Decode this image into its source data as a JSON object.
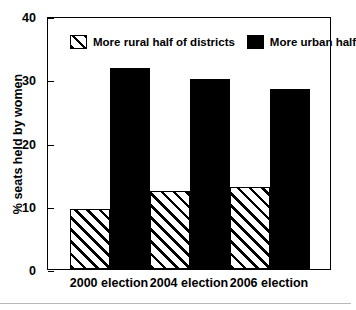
{
  "chart_data": {
    "type": "bar",
    "title": "",
    "xlabel": "",
    "ylabel": "% seats held by women",
    "categories": [
      "2000 election",
      "2004 election",
      "2006 election"
    ],
    "series": [
      {
        "name": "More rural half of districts",
        "values": [
          9.5,
          12.3,
          13.0
        ],
        "fill": "diagonal-hatch",
        "color": "#000000"
      },
      {
        "name": "More urban half",
        "values": [
          31.8,
          30.0,
          28.5
        ],
        "fill": "solid",
        "color": "#000000"
      }
    ],
    "ylim": [
      0,
      40
    ],
    "yticks": [
      0,
      10,
      20,
      30,
      40
    ],
    "ytick_labels": [
      "0",
      "10",
      "20",
      "30",
      "40"
    ],
    "grid": false,
    "legend_position": "top-inside",
    "frame": "box",
    "tick_direction": "in"
  },
  "axes": {
    "y_title": "% seats held by women",
    "y_tick_labels": [
      "40",
      "30",
      "20",
      "10",
      "0"
    ],
    "x_tick_labels": [
      "2000 election",
      "2004 election",
      "2006 election"
    ]
  },
  "legend": {
    "items": [
      {
        "label": "More rural half of districts",
        "swatch": "hatched-swatch"
      },
      {
        "label": "More urban half",
        "swatch": "solid-black-swatch"
      }
    ]
  }
}
